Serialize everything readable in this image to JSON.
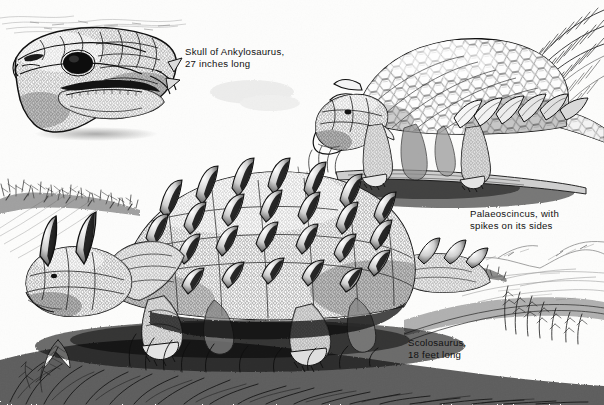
{
  "plate": {
    "medium": "pen-and-ink line engraving",
    "palette": {
      "ink": "#111111",
      "paper": "#fdfdfc",
      "mid_tone": "#6b6b6b",
      "light_tone": "#b9b9b9"
    },
    "width": 604,
    "height": 405
  },
  "captions": {
    "skull": "Skull of Ankylosaurus,\n27 inches long",
    "palaeoscincus": "Palaeoscincus, with\nspikes on its sides",
    "scolosaurus": "Scolosaurus,\n18 feet long"
  },
  "figures": [
    {
      "name": "skull-of-ankylosaurus",
      "label": "Skull of Ankylosaurus, 27 inches long",
      "position": "upper-left inset",
      "features": [
        "triangular armored skull in left profile",
        "dark round eye socket",
        "fused cranial plates",
        "lower jaw with tooth row",
        "beaked snout"
      ]
    },
    {
      "name": "palaeoscincus",
      "label": "Palaeoscincus, with spikes on its sides",
      "position": "upper-right",
      "features": [
        "low browsing posture",
        "domed back of hexagonal scutes",
        "row of lateral flank spikes",
        "stout pebbled legs",
        "head lowered to ground"
      ]
    },
    {
      "name": "scolosaurus",
      "label": "Scolosaurus, 18 feet long",
      "position": "foreground, lower-left and center",
      "features": [
        "broad armored carapace",
        "rows of large conical knobs",
        "two horns on the head",
        "cobblestone osteoderm texture",
        "short sprawling limbs"
      ]
    }
  ],
  "background": {
    "elements": [
      {
        "name": "distant-horizon-sketch",
        "position": "top-left"
      },
      {
        "name": "hillside-shrubs",
        "position": "left-middle"
      },
      {
        "name": "cycad-frond",
        "position": "top-right"
      },
      {
        "name": "lake-shoreline",
        "position": "right-lower"
      },
      {
        "name": "distant-hills",
        "position": "right"
      },
      {
        "name": "foreground-grass-tuft",
        "position": "bottom"
      },
      {
        "name": "fern-leaf",
        "position": "bottom-left"
      }
    ]
  }
}
